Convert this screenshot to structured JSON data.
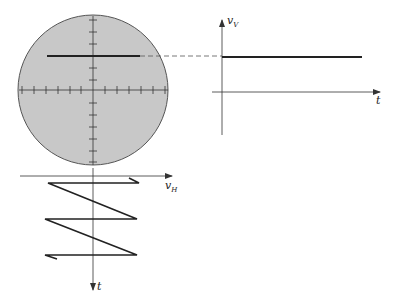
{
  "figure": {
    "screen": {
      "fill_color": "#c8c8c8",
      "outline_color": "#555555",
      "trace_color": "#222222"
    },
    "vertical_signal_graph": {
      "y_axis_label": "v",
      "y_axis_subscript": "V",
      "x_axis_label": "t",
      "waveform": "constant (DC)"
    },
    "horizontal_sweep_graph": {
      "x_axis_label": "v",
      "x_axis_subscript": "H",
      "y_axis_label": "t",
      "waveform": "sawtooth"
    }
  }
}
